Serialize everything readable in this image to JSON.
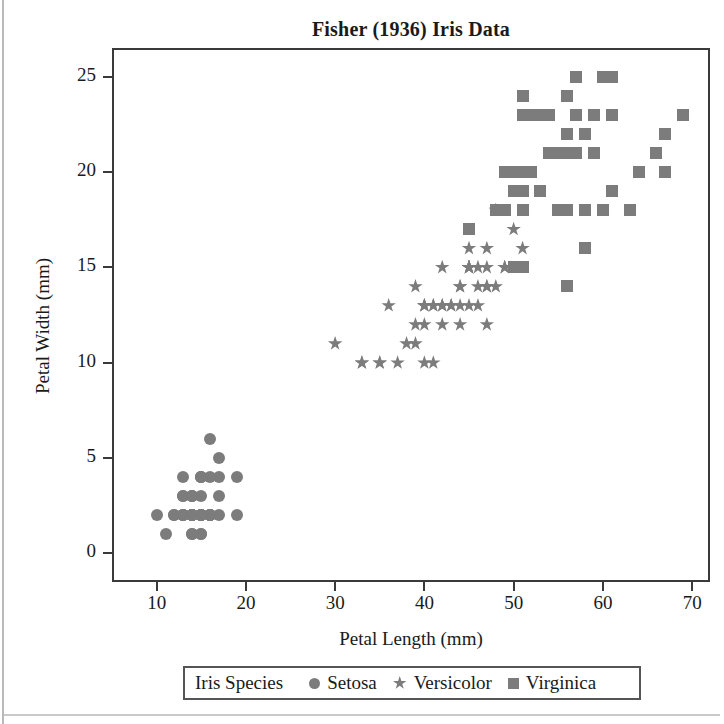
{
  "chart_data": {
    "type": "scatter",
    "title": "Fisher (1936) Iris Data",
    "xlabel": "Petal Length (mm)",
    "ylabel": "Petal Width (mm)",
    "xlim": [
      5,
      72
    ],
    "ylim": [
      -1.5,
      26.5
    ],
    "xticks": [
      10,
      20,
      30,
      40,
      50,
      60,
      70
    ],
    "yticks": [
      0,
      5,
      10,
      15,
      20,
      25
    ],
    "grid": false,
    "legend_position": "bottom",
    "legend_title": "Iris Species",
    "marker_color": "#7c7c7c",
    "series": [
      {
        "name": "Setosa",
        "marker": "circle",
        "points": [
          [
            14,
            2
          ],
          [
            14,
            2
          ],
          [
            13,
            2
          ],
          [
            15,
            2
          ],
          [
            14,
            2
          ],
          [
            17,
            4
          ],
          [
            14,
            3
          ],
          [
            15,
            2
          ],
          [
            14,
            2
          ],
          [
            15,
            1
          ],
          [
            15,
            2
          ],
          [
            16,
            2
          ],
          [
            14,
            1
          ],
          [
            11,
            1
          ],
          [
            12,
            2
          ],
          [
            15,
            4
          ],
          [
            13,
            4
          ],
          [
            14,
            3
          ],
          [
            17,
            3
          ],
          [
            15,
            3
          ],
          [
            17,
            2
          ],
          [
            15,
            4
          ],
          [
            10,
            2
          ],
          [
            17,
            5
          ],
          [
            19,
            2
          ],
          [
            16,
            2
          ],
          [
            16,
            4
          ],
          [
            15,
            2
          ],
          [
            14,
            2
          ],
          [
            16,
            2
          ],
          [
            16,
            2
          ],
          [
            15,
            4
          ],
          [
            15,
            1
          ],
          [
            14,
            2
          ],
          [
            15,
            2
          ],
          [
            12,
            2
          ],
          [
            13,
            2
          ],
          [
            14,
            1
          ],
          [
            13,
            2
          ],
          [
            15,
            2
          ],
          [
            13,
            3
          ],
          [
            13,
            3
          ],
          [
            13,
            2
          ],
          [
            16,
            6
          ],
          [
            19,
            4
          ],
          [
            14,
            3
          ],
          [
            16,
            2
          ],
          [
            14,
            2
          ],
          [
            15,
            2
          ],
          [
            14,
            2
          ]
        ]
      },
      {
        "name": "Versicolor",
        "marker": "star",
        "points": [
          [
            47,
            14
          ],
          [
            45,
            15
          ],
          [
            49,
            15
          ],
          [
            40,
            13
          ],
          [
            46,
            15
          ],
          [
            45,
            13
          ],
          [
            47,
            16
          ],
          [
            33,
            10
          ],
          [
            46,
            13
          ],
          [
            39,
            14
          ],
          [
            35,
            10
          ],
          [
            42,
            15
          ],
          [
            40,
            10
          ],
          [
            47,
            14
          ],
          [
            36,
            13
          ],
          [
            44,
            14
          ],
          [
            45,
            15
          ],
          [
            41,
            10
          ],
          [
            45,
            15
          ],
          [
            39,
            11
          ],
          [
            48,
            18
          ],
          [
            40,
            13
          ],
          [
            49,
            15
          ],
          [
            47,
            12
          ],
          [
            43,
            13
          ],
          [
            44,
            14
          ],
          [
            48,
            14
          ],
          [
            50,
            17
          ],
          [
            45,
            15
          ],
          [
            35,
            10
          ],
          [
            38,
            11
          ],
          [
            37,
            10
          ],
          [
            39,
            12
          ],
          [
            51,
            16
          ],
          [
            45,
            15
          ],
          [
            45,
            16
          ],
          [
            47,
            15
          ],
          [
            44,
            13
          ],
          [
            41,
            13
          ],
          [
            40,
            13
          ],
          [
            44,
            12
          ],
          [
            46,
            14
          ],
          [
            40,
            12
          ],
          [
            33,
            10
          ],
          [
            42,
            13
          ],
          [
            42,
            12
          ],
          [
            42,
            13
          ],
          [
            43,
            13
          ],
          [
            30,
            11
          ],
          [
            41,
            13
          ]
        ]
      },
      {
        "name": "Virginica",
        "marker": "square",
        "points": [
          [
            60,
            25
          ],
          [
            51,
            19
          ],
          [
            59,
            21
          ],
          [
            56,
            18
          ],
          [
            58,
            22
          ],
          [
            66,
            21
          ],
          [
            45,
            17
          ],
          [
            63,
            18
          ],
          [
            58,
            18
          ],
          [
            61,
            25
          ],
          [
            51,
            20
          ],
          [
            53,
            19
          ],
          [
            55,
            21
          ],
          [
            50,
            20
          ],
          [
            51,
            24
          ],
          [
            53,
            23
          ],
          [
            55,
            18
          ],
          [
            67,
            22
          ],
          [
            69,
            23
          ],
          [
            50,
            15
          ],
          [
            57,
            23
          ],
          [
            49,
            20
          ],
          [
            67,
            20
          ],
          [
            49,
            18
          ],
          [
            57,
            21
          ],
          [
            60,
            18
          ],
          [
            48,
            18
          ],
          [
            49,
            18
          ],
          [
            56,
            21
          ],
          [
            58,
            16
          ],
          [
            61,
            19
          ],
          [
            64,
            20
          ],
          [
            56,
            22
          ],
          [
            51,
            15
          ],
          [
            56,
            14
          ],
          [
            61,
            23
          ],
          [
            56,
            24
          ],
          [
            55,
            18
          ],
          [
            48,
            18
          ],
          [
            54,
            21
          ],
          [
            56,
            24
          ],
          [
            51,
            23
          ],
          [
            51,
            19
          ],
          [
            59,
            23
          ],
          [
            57,
            25
          ],
          [
            52,
            23
          ],
          [
            50,
            19
          ],
          [
            52,
            20
          ],
          [
            54,
            23
          ],
          [
            51,
            18
          ]
        ]
      }
    ]
  },
  "title": "Fisher (1936) Iris Data",
  "axes": {
    "x_title": "Petal Length (mm)",
    "y_title": "Petal Width (mm)",
    "x_tick_labels": [
      "10",
      "20",
      "30",
      "40",
      "50",
      "60",
      "70"
    ],
    "y_tick_labels": [
      "25",
      "20",
      "15",
      "10",
      "5",
      "0"
    ]
  },
  "legend": {
    "title": "Iris Species",
    "entries": [
      {
        "label": "Setosa",
        "marker": "circle-marker"
      },
      {
        "label": "Versicolor",
        "marker": "star-marker"
      },
      {
        "label": "Virginica",
        "marker": "square-marker"
      }
    ]
  }
}
